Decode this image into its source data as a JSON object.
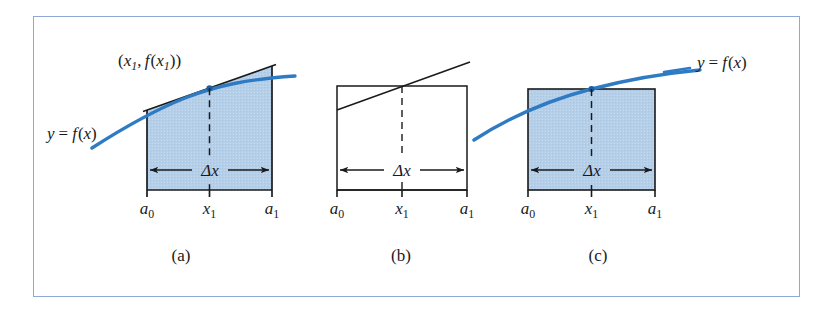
{
  "figure": {
    "domain": "Diagram",
    "frame_color": "#8fa8d8",
    "curve_color": "#2e7bc4",
    "shade_color": "#b6cfe9",
    "line_color": "#1a1a1a",
    "background": "#ffffff"
  },
  "panels": [
    {
      "id": "a",
      "caption": "(a)",
      "shaded": true,
      "shape": "trapezoid",
      "labels": {
        "point_label": "(x₁, f(x₁))",
        "point_label_parts": {
          "open": "(",
          "x": "x",
          "x_sub": "1",
          "comma": ", ",
          "f": "f",
          "fopen": "(",
          "fx": "x",
          "fx_sub": "1",
          "close": "))"
        },
        "curve_label": "y = f(x)",
        "delta_label": "Δx",
        "tick_left": "a₀",
        "tick_mid": "x₁",
        "tick_right": "a₁"
      }
    },
    {
      "id": "b",
      "caption": "(b)",
      "shaded": false,
      "shape": "rectangle-with-tangent",
      "labels": {
        "delta_label": "Δx",
        "tick_left": "a₀",
        "tick_mid": "x₁",
        "tick_right": "a₁"
      }
    },
    {
      "id": "c",
      "caption": "(c)",
      "shaded": true,
      "shape": "rectangle",
      "labels": {
        "curve_label": "y = f(x)",
        "delta_label": "Δx",
        "tick_left": "a₀",
        "tick_mid": "x₁",
        "tick_right": "a₁"
      }
    }
  ],
  "axis_ticks": {
    "left": {
      "base": "a",
      "sub": "0"
    },
    "mid": {
      "base": "x",
      "sub": "1"
    },
    "right": {
      "base": "a",
      "sub": "1"
    }
  },
  "symbols": {
    "delta_x": "Δx",
    "y_equals": "y = f(x)"
  }
}
